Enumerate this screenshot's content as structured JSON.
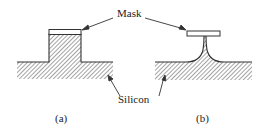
{
  "labels": {
    "mask": "Mask",
    "silicon": "Silicon",
    "panel_a": "(a)",
    "panel_b": "(b)"
  },
  "colors": {
    "line": "#333333",
    "hatch": "#555555",
    "background": "#ffffff"
  }
}
